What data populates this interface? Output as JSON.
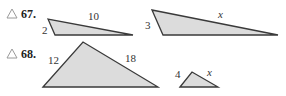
{
  "problems": [
    {
      "number": "67.",
      "marker_icon": "triangle-outline-icon",
      "triangles": [
        {
          "side_labels": [
            "2",
            "10"
          ]
        },
        {
          "side_labels": [
            "3",
            "x"
          ]
        }
      ]
    },
    {
      "number": "68.",
      "marker_icon": "triangle-outline-icon",
      "triangles": [
        {
          "side_labels": [
            "12",
            "18"
          ]
        },
        {
          "side_labels": [
            "4",
            "x"
          ]
        }
      ]
    }
  ],
  "colors": {
    "fill": "#dcdcdc",
    "stroke": "#3a3a3a",
    "marker": "#9a9a9a"
  }
}
